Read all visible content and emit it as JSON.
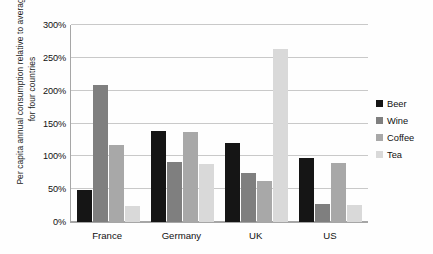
{
  "chart_data": {
    "type": "bar",
    "title": "",
    "subtitle": "",
    "xlabel": "",
    "ylabel": "Per capita annual consumption relative to average for four countries",
    "categories": [
      "France",
      "Germany",
      "UK",
      "US"
    ],
    "series": [
      {
        "name": "Beer",
        "color": "#151515",
        "values": [
          48,
          138,
          120,
          97
        ]
      },
      {
        "name": "Wine",
        "color": "#7f7f7f",
        "values": [
          208,
          92,
          75,
          28
        ]
      },
      {
        "name": "Coffee",
        "color": "#a8a8a8",
        "values": [
          117,
          137,
          62,
          90
        ]
      },
      {
        "name": "Tea",
        "color": "#d9d9d9",
        "values": [
          25,
          88,
          263,
          26
        ]
      }
    ],
    "ylim": [
      0,
      300
    ],
    "ytick_step": 50,
    "ytick_labels": [
      "0%",
      "50%",
      "100%",
      "150%",
      "200%",
      "250%",
      "300%"
    ],
    "ytick_values": [
      0,
      50,
      100,
      150,
      200,
      250,
      300
    ],
    "grid": true,
    "grid_axis": "y",
    "legend_position": "right",
    "value_suffix": "%",
    "background_color": "#ffffff",
    "grid_color": "#c9c9c9",
    "axis_color": "#a6a6a6",
    "text_color": "#111111"
  }
}
